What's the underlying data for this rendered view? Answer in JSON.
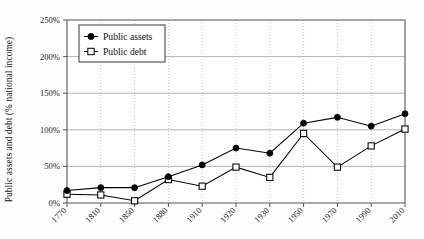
{
  "chart_data": {
    "type": "line",
    "title": "",
    "subtitle": "",
    "xlabel": "",
    "ylabel": "Public assets and debt (% national income)",
    "categories": [
      "1770",
      "1810",
      "1850",
      "1880",
      "1910",
      "1920",
      "1930",
      "1950",
      "1970",
      "1990",
      "2010"
    ],
    "series": [
      {
        "name": "Public assets",
        "marker": "filled-circle",
        "color": "#000000",
        "values": [
          17,
          21,
          21,
          36,
          52,
          75,
          68,
          109,
          117,
          105,
          122
        ]
      },
      {
        "name": "Public debt",
        "marker": "open-square",
        "color": "#000000",
        "values": [
          12,
          11,
          3,
          32,
          23,
          49,
          35,
          95,
          49,
          78,
          101
        ]
      }
    ],
    "ylim": [
      0,
      250
    ],
    "ytick_values": [
      0,
      50,
      100,
      150,
      200,
      250
    ],
    "ytick_labels": [
      "0%",
      "50%",
      "100%",
      "150%",
      "200%",
      "250%"
    ],
    "grid": {
      "horizontal": true,
      "vertical": true,
      "horizontal_style": "solid",
      "vertical_style": "dotted",
      "color": "#aaaaaa"
    },
    "legend": {
      "position": "upper-left-inside",
      "entries": [
        "Public assets",
        "Public debt"
      ],
      "border": true
    },
    "axis_color": "#555555",
    "background_color": "#fdfdfd"
  },
  "legend": {
    "assets_label": "Public assets",
    "debt_label": "Public debt"
  },
  "axes": {
    "y_title": "Public assets and debt (% national income)"
  }
}
